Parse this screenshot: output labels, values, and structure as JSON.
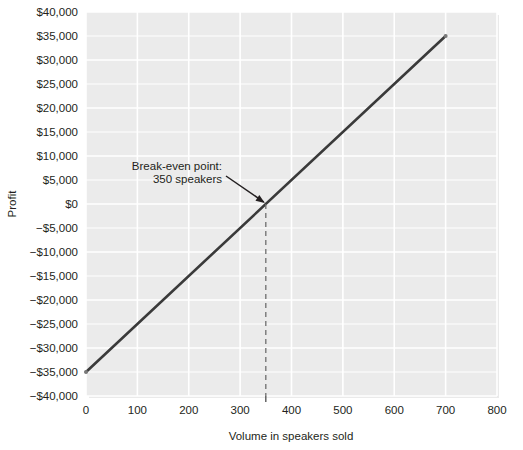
{
  "chart_data": {
    "type": "line",
    "title": "",
    "xlabel": "Volume in speakers sold",
    "ylabel": "Profit",
    "xlim": [
      0,
      800
    ],
    "ylim": [
      -40000,
      40000
    ],
    "grid": true,
    "legend": "none",
    "x_ticks": [
      "0",
      "100",
      "200",
      "300",
      "400",
      "500",
      "600",
      "700",
      "800"
    ],
    "x_tick_values": [
      0,
      100,
      200,
      300,
      400,
      500,
      600,
      700,
      800
    ],
    "y_ticks": [
      "$40,000",
      "$35,000",
      "$30,000",
      "$25,000",
      "$20,000",
      "$15,000",
      "$10,000",
      "$5,000",
      "$0",
      "−$5,000",
      "−$10,000",
      "−$15,000",
      "−$20,000",
      "−$25,000",
      "−$30,000",
      "−$35,000",
      "−$40,000"
    ],
    "y_tick_values": [
      40000,
      35000,
      30000,
      25000,
      20000,
      15000,
      10000,
      5000,
      0,
      -5000,
      -10000,
      -15000,
      -20000,
      -25000,
      -30000,
      -35000,
      -40000
    ],
    "series": [
      {
        "name": "Profit",
        "x": [
          0,
          700
        ],
        "values": [
          -35000,
          35000
        ]
      }
    ],
    "annotations": [
      {
        "name": "break-even",
        "line1": "Break-even point:",
        "line2": "350 speakers",
        "x": 350,
        "y": 0
      }
    ],
    "colors": {
      "line": "#3a3a3a",
      "plot_background": "#ebebeb",
      "gridline": "#ffffff",
      "text": "#231f20",
      "dashed_marker": "#6e6e6e"
    }
  }
}
